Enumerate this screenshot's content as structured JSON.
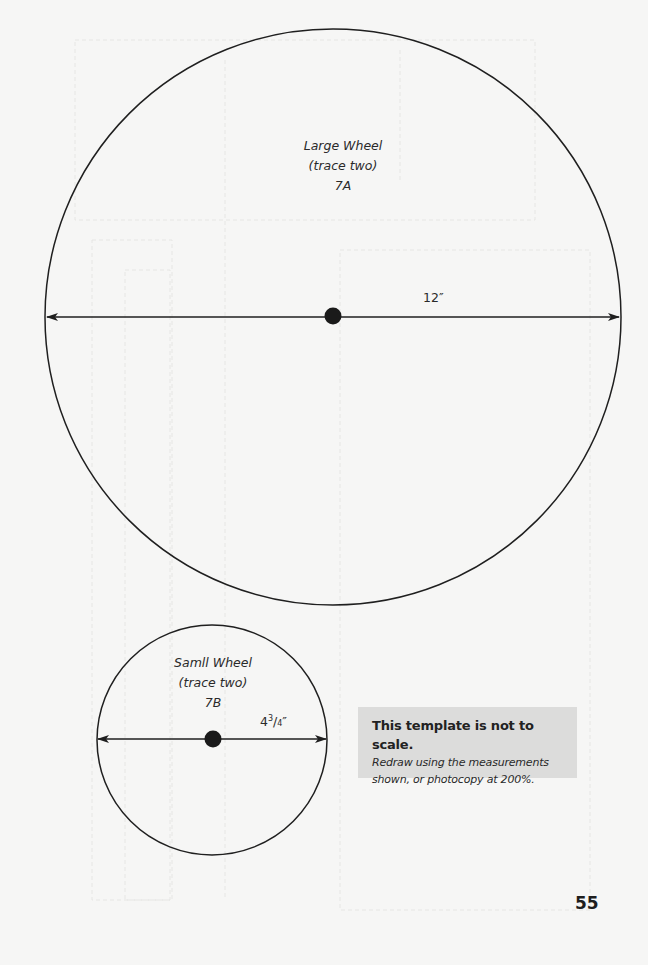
{
  "large_wheel": {
    "name": "Large Wheel",
    "instruction": "(trace two)",
    "part_id": "7A",
    "measurement": "12″",
    "circle": {
      "cx": 333,
      "cy": 317,
      "r": 288
    }
  },
  "small_wheel": {
    "name": "Samll Wheel",
    "instruction": "(trace two)",
    "part_id": "7B",
    "measurement": {
      "whole": "4",
      "numerator": "3",
      "denominator": "4",
      "unit": "″"
    },
    "circle": {
      "cx": 212,
      "cy": 740,
      "r": 115
    }
  },
  "note": {
    "title": "This template is not to scale.",
    "line1": "Redraw using the measurements",
    "line2": "shown, or photocopy at 200%."
  },
  "page_number": "55",
  "colors": {
    "stroke": "#1f1f1f",
    "note_background": "#dcdcdb",
    "page_background": "#f6f6f5"
  }
}
